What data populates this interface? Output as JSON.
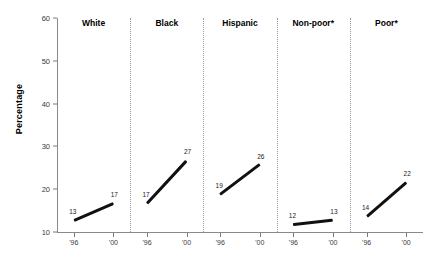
{
  "chart_data": {
    "type": "line",
    "title": "",
    "xlabel": "",
    "ylabel": "Percentage",
    "ylim": [
      10,
      60
    ],
    "yticks": [
      10,
      20,
      30,
      40,
      50,
      60
    ],
    "x": [
      "'96",
      "'00"
    ],
    "grid": false,
    "legend": "none",
    "panel_layout": "small-multiples",
    "panels": [
      {
        "label": "White",
        "values": [
          13,
          17
        ],
        "point_labels": [
          "13",
          "17"
        ]
      },
      {
        "label": "Black",
        "values": [
          17,
          27
        ],
        "point_labels": [
          "17",
          "27"
        ]
      },
      {
        "label": "Hispanic",
        "values": [
          19,
          26
        ],
        "point_labels": [
          "19",
          "26"
        ]
      },
      {
        "label": "Non-poor*",
        "values": [
          12,
          13
        ],
        "point_labels": [
          "12",
          "13"
        ]
      },
      {
        "label": "Poor*",
        "values": [
          14,
          22
        ],
        "point_labels": [
          "14",
          "22"
        ]
      }
    ]
  },
  "axis": {
    "y_title": "Percentage",
    "y_tick_labels": [
      "60",
      "50",
      "40",
      "30",
      "20",
      "10"
    ],
    "x_tick_labels": [
      "'96",
      "'00"
    ]
  }
}
